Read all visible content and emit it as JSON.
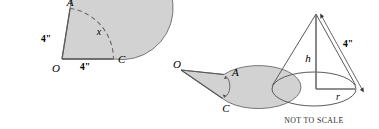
{
  "figure": {
    "caption": "NOT TO SCALE",
    "colors": {
      "fill": "#d2d2d2",
      "stroke": "#5a5a5a",
      "text": "#1a1a1a",
      "background": "#ffffff"
    }
  },
  "figures": [
    {
      "name": "circle-with-sector-removed",
      "shape": "circle",
      "labels": {
        "center": "O",
        "point_a": "A",
        "point_c": "C",
        "radius_oa": "4\"",
        "radius_oc": "4\"",
        "arc": "x"
      }
    },
    {
      "name": "rolled-ellipse",
      "shape": "ellipse",
      "labels": {
        "center": "O",
        "point_a": "A",
        "point_c": "C"
      }
    },
    {
      "name": "cone",
      "shape": "cone",
      "labels": {
        "slant_height": "4\"",
        "height": "h",
        "radius": "r"
      },
      "caption": "NOT TO SCALE"
    }
  ]
}
